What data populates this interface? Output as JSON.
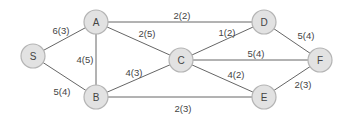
{
  "diagram": {
    "type": "flow-network-graph",
    "nodes": [
      {
        "id": "S",
        "label": "S",
        "x": 33,
        "y": 56
      },
      {
        "id": "A",
        "label": "A",
        "x": 96,
        "y": 22
      },
      {
        "id": "B",
        "label": "B",
        "x": 96,
        "y": 97
      },
      {
        "id": "C",
        "label": "C",
        "x": 181,
        "y": 60
      },
      {
        "id": "D",
        "label": "D",
        "x": 264,
        "y": 22
      },
      {
        "id": "E",
        "label": "E",
        "x": 264,
        "y": 97
      },
      {
        "id": "F",
        "label": "F",
        "x": 320,
        "y": 60
      }
    ],
    "edges": [
      {
        "from": "S",
        "to": "A",
        "label": "6(3)",
        "lx": 61,
        "ly": 30
      },
      {
        "from": "S",
        "to": "B",
        "label": "5(4)",
        "lx": 62,
        "ly": 91
      },
      {
        "from": "A",
        "to": "B",
        "label": "4(5)",
        "lx": 85,
        "ly": 59
      },
      {
        "from": "A",
        "to": "D",
        "label": "2(2)",
        "lx": 182,
        "ly": 15
      },
      {
        "from": "A",
        "to": "C",
        "label": "2(5)",
        "lx": 147,
        "ly": 33
      },
      {
        "from": "B",
        "to": "C",
        "label": "4(3)",
        "lx": 134,
        "ly": 72
      },
      {
        "from": "B",
        "to": "E",
        "label": "2(3)",
        "lx": 183,
        "ly": 108
      },
      {
        "from": "C",
        "to": "D",
        "label": "1(2)",
        "lx": 227,
        "ly": 32
      },
      {
        "from": "C",
        "to": "F",
        "label": "5(4)",
        "lx": 256,
        "ly": 53
      },
      {
        "from": "C",
        "to": "E",
        "label": "4(2)",
        "lx": 236,
        "ly": 74
      },
      {
        "from": "D",
        "to": "F",
        "label": "5(4)",
        "lx": 306,
        "ly": 35
      },
      {
        "from": "E",
        "to": "F",
        "label": "2(3)",
        "lx": 303,
        "ly": 84
      }
    ]
  }
}
